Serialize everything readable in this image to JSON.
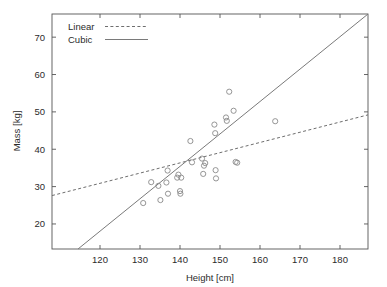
{
  "chart_data": {
    "type": "scatter",
    "title": "",
    "xlabel": "Height [cm]",
    "ylabel": "Mass [kg]",
    "xlim": [
      108,
      187
    ],
    "ylim": [
      13.3,
      76.2
    ],
    "xticks": [
      120,
      130,
      140,
      150,
      160,
      170,
      180
    ],
    "yticks": [
      20,
      30,
      40,
      50,
      60,
      70
    ],
    "grid": false,
    "legend_position": "top-left",
    "legend": [
      {
        "name": "Linear",
        "style": "dashed"
      },
      {
        "name": "Cubic",
        "style": "solid"
      }
    ],
    "points": [
      {
        "x": 130.8,
        "y": 25.6
      },
      {
        "x": 132.8,
        "y": 31.2
      },
      {
        "x": 134.6,
        "y": 30.2
      },
      {
        "x": 135.1,
        "y": 26.4
      },
      {
        "x": 136.6,
        "y": 31.1
      },
      {
        "x": 136.9,
        "y": 34.3
      },
      {
        "x": 137.0,
        "y": 28.1
      },
      {
        "x": 139.3,
        "y": 32.4
      },
      {
        "x": 139.6,
        "y": 33.2
      },
      {
        "x": 140.0,
        "y": 28.8
      },
      {
        "x": 140.1,
        "y": 28.1
      },
      {
        "x": 140.3,
        "y": 32.4
      },
      {
        "x": 142.6,
        "y": 42.2
      },
      {
        "x": 143.0,
        "y": 36.5
      },
      {
        "x": 145.5,
        "y": 37.5
      },
      {
        "x": 145.8,
        "y": 33.4
      },
      {
        "x": 146.0,
        "y": 35.6
      },
      {
        "x": 146.3,
        "y": 36.3
      },
      {
        "x": 148.6,
        "y": 46.6
      },
      {
        "x": 148.8,
        "y": 44.3
      },
      {
        "x": 148.9,
        "y": 34.4
      },
      {
        "x": 149.0,
        "y": 32.2
      },
      {
        "x": 151.5,
        "y": 48.5
      },
      {
        "x": 151.7,
        "y": 47.6
      },
      {
        "x": 152.3,
        "y": 55.4
      },
      {
        "x": 153.4,
        "y": 50.3
      },
      {
        "x": 153.9,
        "y": 36.6
      },
      {
        "x": 154.3,
        "y": 36.4
      },
      {
        "x": 163.8,
        "y": 47.5
      }
    ],
    "series": [
      {
        "name": "Linear",
        "style": "dashed",
        "type": "line",
        "endpoints": [
          {
            "x": 108,
            "y": 27.6
          },
          {
            "x": 187,
            "y": 49.2
          }
        ]
      },
      {
        "name": "Cubic",
        "style": "solid",
        "type": "line",
        "endpoints": [
          {
            "x": 114.5,
            "y": 13.3
          },
          {
            "x": 187,
            "y": 76.2
          }
        ]
      }
    ]
  }
}
